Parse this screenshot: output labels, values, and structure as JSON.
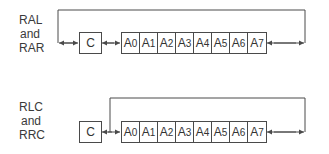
{
  "diagrams": [
    {
      "id": "ral-rar",
      "label_lines": [
        "RAL",
        "and",
        "RAR"
      ],
      "carry_label": "C",
      "cells": [
        {
          "base": "A",
          "sub": "0"
        },
        {
          "base": "A",
          "sub": "1"
        },
        {
          "base": "A",
          "sub": "2"
        },
        {
          "base": "A",
          "sub": "3"
        },
        {
          "base": "A",
          "sub": "4"
        },
        {
          "base": "A",
          "sub": "5"
        },
        {
          "base": "A",
          "sub": "6"
        },
        {
          "base": "A",
          "sub": "7"
        }
      ],
      "loop": "through-carry"
    },
    {
      "id": "rlc-rrc",
      "label_lines": [
        "RLC",
        "and",
        "RRC"
      ],
      "carry_label": "C",
      "cells": [
        {
          "base": "A",
          "sub": "0"
        },
        {
          "base": "A",
          "sub": "1"
        },
        {
          "base": "A",
          "sub": "2"
        },
        {
          "base": "A",
          "sub": "3"
        },
        {
          "base": "A",
          "sub": "4"
        },
        {
          "base": "A",
          "sub": "5"
        },
        {
          "base": "A",
          "sub": "6"
        },
        {
          "base": "A",
          "sub": "7"
        }
      ],
      "loop": "bypass-carry"
    }
  ],
  "colors": {
    "line": "#4a4a4a",
    "text": "#333333",
    "background": "#ffffff"
  }
}
